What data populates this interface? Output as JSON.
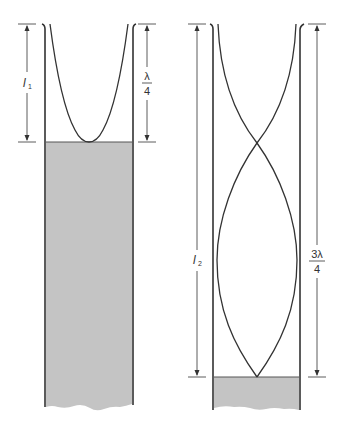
{
  "figure": {
    "colors": {
      "line": "#333333",
      "water": "#c4c4c4",
      "background": "#ffffff"
    },
    "left_tube": {
      "length_label": "l",
      "length_subscript": "1",
      "wavelength_label_num": "λ",
      "wavelength_label_den": "4"
    },
    "right_tube": {
      "length_label": "l",
      "length_subscript": "2",
      "wavelength_label_num": "3λ",
      "wavelength_label_den": "4"
    }
  }
}
